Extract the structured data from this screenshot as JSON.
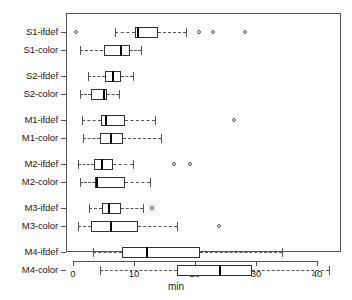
{
  "chart_data": {
    "type": "box",
    "title": "",
    "xlabel": "min",
    "ylabel": "",
    "orientation": "horizontal",
    "xlim": [
      -1.0,
      44.0
    ],
    "xticks": [
      0,
      10,
      20,
      30,
      40
    ],
    "xtick_labels": [
      "0",
      "10",
      "20",
      "30",
      "40"
    ],
    "grid": false,
    "legend": "none",
    "categories": [
      "S1-ifdef",
      "S1-color",
      "S2-ifdef",
      "S2-color",
      "M1-ifdef",
      "M1-color",
      "M2-ifdef",
      "M2-color",
      "M3-ifdef",
      "M3-color",
      "M4-ifdef",
      "M4-color"
    ],
    "boxes": [
      {
        "label": "S1-ifdef",
        "whisker_low": 6.9,
        "q1": 10.1,
        "median": 10.6,
        "q3": 14.0,
        "whisker_high": 18.6,
        "outliers": [
          0.5,
          20.6,
          23.0,
          28.2
        ]
      },
      {
        "label": "S1-color",
        "whisker_low": 1.2,
        "q1": 5.0,
        "median": 7.9,
        "q3": 9.3,
        "whisker_high": 11.1,
        "outliers": []
      },
      {
        "label": "S2-ifdef",
        "whisker_low": 2.5,
        "q1": 5.3,
        "median": 6.5,
        "q3": 7.8,
        "whisker_high": 9.8,
        "outliers": []
      },
      {
        "label": "S2-color",
        "whisker_low": 1.1,
        "q1": 3.0,
        "median": 5.1,
        "q3": 5.6,
        "whisker_high": 7.6,
        "outliers": []
      },
      {
        "label": "M1-ifdef",
        "whisker_low": 1.5,
        "q1": 4.6,
        "median": 5.4,
        "q3": 8.6,
        "whisker_high": 13.5,
        "outliers": [
          26.4
        ]
      },
      {
        "label": "M1-color",
        "whisker_low": 1.7,
        "q1": 4.4,
        "median": 6.3,
        "q3": 8.2,
        "whisker_high": 14.4,
        "outliers": []
      },
      {
        "label": "M2-ifdef",
        "whisker_low": 0.9,
        "q1": 3.5,
        "median": 4.8,
        "q3": 6.5,
        "whisker_high": 9.8,
        "outliers": [
          16.6,
          19.2
        ]
      },
      {
        "label": "M2-color",
        "whisker_low": 1.2,
        "q1": 3.6,
        "median": 4.0,
        "q3": 8.6,
        "whisker_high": 12.6,
        "outliers": []
      },
      {
        "label": "M3-ifdef",
        "whisker_low": 2.7,
        "q1": 4.8,
        "median": 5.9,
        "q3": 7.9,
        "whisker_high": 11.4,
        "outliers": [
          13.0
        ]
      },
      {
        "label": "M3-color",
        "whisker_low": 0.9,
        "q1": 3.0,
        "median": 6.3,
        "q3": 10.6,
        "whisker_high": 17.0,
        "outliers": [
          23.9
        ]
      },
      {
        "label": "M4-ifdef",
        "whisker_low": 3.3,
        "q1": 8.0,
        "median": 12.2,
        "q3": 20.8,
        "whisker_high": 34.3,
        "outliers": []
      },
      {
        "label": "M4-color",
        "whisker_low": 4.5,
        "q1": 17.0,
        "median": 24.1,
        "q3": 29.3,
        "whisker_high": 41.9,
        "outliers": []
      }
    ]
  }
}
